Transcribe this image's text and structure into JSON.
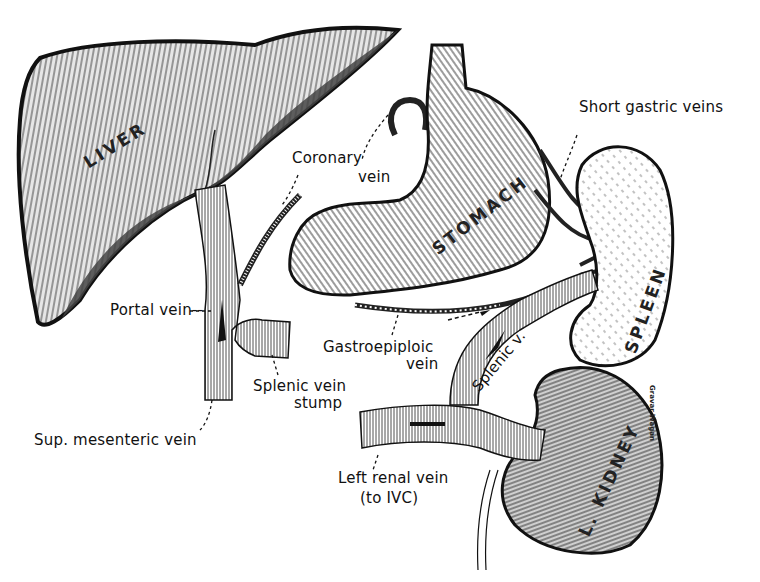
{
  "figure": {
    "type": "anatomical illustration"
  },
  "organs": {
    "liver": "LIVER",
    "stomach": "STOMACH",
    "spleen": "SPLEEN",
    "kidney": "L. KIDNEY"
  },
  "labels": {
    "coronary_vein": "Coronary",
    "coronary_vein_2": "vein",
    "short_gastric": "Short gastric veins",
    "portal_vein": "Portal vein--",
    "gastroepiploic": "Gastroepiploic",
    "gastroepiploic_2": "vein",
    "splenic_stump": "Splenic vein",
    "splenic_stump_2": "stump",
    "splenic_v": "Splenic v.",
    "sup_mesenteric": "Sup. mesenteric vein",
    "left_renal": "Left renal vein",
    "left_renal_2": "(to IVC)"
  },
  "signature": "Gravar Wagan",
  "colors": {
    "ink": "#111111",
    "paper": "#ffffff",
    "shade": "#555555",
    "stipple": "#bbbbbb"
  }
}
